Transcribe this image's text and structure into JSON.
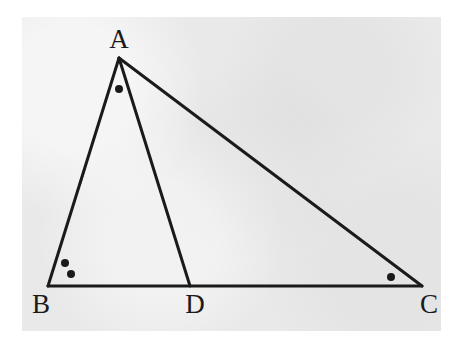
{
  "figure": {
    "canvas": {
      "width": 463,
      "height": 344
    },
    "paper": {
      "x": 22,
      "y": 17,
      "width": 419,
      "height": 314,
      "color": "#e9e9e9"
    },
    "stroke_color": "#1a1a1a",
    "stroke_width": 3,
    "points": {
      "A": {
        "x": 119,
        "y": 58
      },
      "B": {
        "x": 48,
        "y": 286
      },
      "C": {
        "x": 422,
        "y": 286
      },
      "D": {
        "x": 190,
        "y": 286
      }
    },
    "labels": [
      {
        "id": "A",
        "text": "A",
        "x": 119,
        "y": 48
      },
      {
        "id": "B",
        "text": "B",
        "x": 41,
        "y": 313
      },
      {
        "id": "C",
        "text": "C",
        "x": 429,
        "y": 313
      },
      {
        "id": "D",
        "text": "D",
        "x": 195,
        "y": 313
      }
    ],
    "segments": [
      {
        "id": "AB",
        "from": "A",
        "to": "B"
      },
      {
        "id": "AC",
        "from": "A",
        "to": "C"
      },
      {
        "id": "BC",
        "from": "B",
        "to": "C"
      },
      {
        "id": "AD",
        "from": "A",
        "to": "D"
      }
    ],
    "tick_marks": [
      {
        "id": "tick-AB",
        "on_segment": "AB",
        "x": 82,
        "y": 177,
        "angle_deg": 107,
        "length": 15
      },
      {
        "id": "tick-DC",
        "on_segment": "DC",
        "x": 305,
        "y": 286,
        "angle_deg": 0,
        "length": 15
      }
    ],
    "angle_dots": [
      {
        "id": "dot-A",
        "at_vertex": "A",
        "x": 119,
        "y": 89,
        "r": 4
      },
      {
        "id": "dot-B-outer",
        "at_vertex": "B",
        "x": 65,
        "y": 263,
        "r": 4
      },
      {
        "id": "dot-B-inner",
        "at_vertex": "B",
        "x": 71,
        "y": 274,
        "r": 4
      },
      {
        "id": "dot-C",
        "at_vertex": "C",
        "x": 391,
        "y": 277,
        "r": 4
      }
    ]
  }
}
